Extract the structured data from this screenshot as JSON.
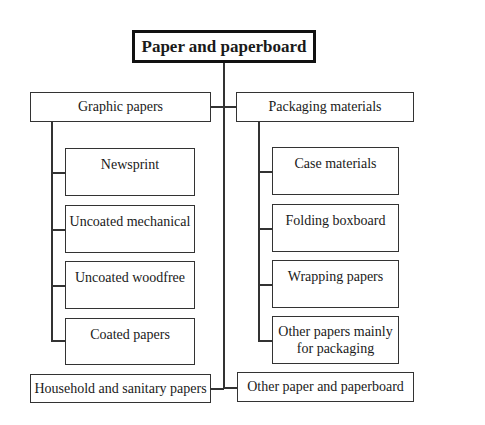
{
  "diagram": {
    "title": "Paper and paperboard",
    "categories": [
      {
        "label": "Graphic papers",
        "children": [
          "Newsprint",
          "Uncoated mechanical",
          "Uncoated woodfree",
          "Coated papers"
        ]
      },
      {
        "label": "Packaging materials",
        "children": [
          "Case materials",
          "Folding boxboard",
          "Wrapping papers",
          "Other papers mainly for packaging"
        ]
      },
      {
        "label": "Household and sanitary papers",
        "children": []
      },
      {
        "label": "Other paper and paperboard",
        "children": []
      }
    ],
    "child_multiline": {
      "other_papers_line1": "Other papers mainly",
      "other_papers_line2": "for packaging"
    }
  }
}
